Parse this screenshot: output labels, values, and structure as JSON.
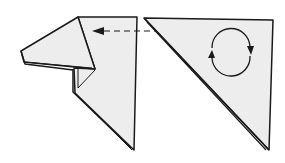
{
  "diagram": {
    "type": "origami-instruction",
    "colors": {
      "paper": "#ededed",
      "line": "#1a1a1a",
      "background": "#ffffff"
    },
    "figures": [
      {
        "id": "left",
        "description": "dog head folded shape (result)"
      },
      {
        "id": "right",
        "description": "triangle to be turned over"
      }
    ],
    "arrows": [
      {
        "id": "move-arrow",
        "style": "dashed",
        "direction": "right-to-left",
        "meaning": "becomes"
      },
      {
        "id": "turn-over-symbol",
        "style": "circular",
        "meaning": "turn over"
      }
    ]
  }
}
